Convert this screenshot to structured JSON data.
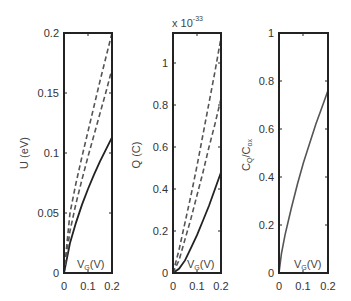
{
  "chart_data": [
    {
      "type": "line",
      "panel": "left",
      "xlabel": "V_G(V)",
      "ylabel": "U (eV)",
      "xlim": [
        0,
        0.2
      ],
      "ylim": [
        0,
        0.2
      ],
      "xticks": [
        "0",
        "0.1",
        "0.2"
      ],
      "yticks": [
        "0",
        "0.05",
        "0.1",
        "0.15",
        "0.2"
      ],
      "grid": false,
      "x": [
        0,
        0.025,
        0.05,
        0.075,
        0.1,
        0.125,
        0.15,
        0.175,
        0.2
      ],
      "series": [
        {
          "name": "solid",
          "style": "solid",
          "values": [
            0,
            0.025,
            0.042,
            0.057,
            0.07,
            0.082,
            0.093,
            0.103,
            0.113
          ]
        },
        {
          "name": "dashed-inner",
          "style": "dashed",
          "values": [
            0,
            0.035,
            0.058,
            0.078,
            0.097,
            0.115,
            0.133,
            0.151,
            0.17
          ]
        },
        {
          "name": "dashed-outer",
          "style": "dashed",
          "values": [
            0,
            0.05,
            0.075,
            0.097,
            0.118,
            0.139,
            0.16,
            0.18,
            0.2
          ]
        }
      ]
    },
    {
      "type": "line",
      "panel": "middle",
      "xlabel": "V_G(V)",
      "ylabel": "Q (C)",
      "multiplier": "x 10^-33",
      "xlim": [
        0,
        0.2
      ],
      "ylim": [
        0,
        1.143
      ],
      "xticks": [
        "0",
        "0.1",
        "0.2"
      ],
      "yticks": [
        "0",
        "0.2",
        "0.4",
        "0.6",
        "0.8",
        "1"
      ],
      "grid": false,
      "x": [
        0,
        0.025,
        0.05,
        0.075,
        0.1,
        0.125,
        0.15,
        0.175,
        0.2
      ],
      "series": [
        {
          "name": "solid",
          "style": "solid",
          "values": [
            0,
            0.02,
            0.06,
            0.12,
            0.18,
            0.25,
            0.32,
            0.4,
            0.48
          ]
        },
        {
          "name": "dashed-inner",
          "style": "dashed",
          "values": [
            0,
            0.06,
            0.16,
            0.26,
            0.37,
            0.48,
            0.6,
            0.71,
            0.83
          ]
        },
        {
          "name": "dashed-outer",
          "style": "dashed",
          "values": [
            0,
            0.11,
            0.24,
            0.37,
            0.51,
            0.66,
            0.81,
            0.96,
            1.12
          ]
        }
      ]
    },
    {
      "type": "line",
      "panel": "right",
      "xlabel": "V_G(V)",
      "ylabel": "C_Q/C_ox",
      "xlim": [
        0,
        0.2
      ],
      "ylim": [
        0,
        1
      ],
      "xticks": [
        "0",
        "0.1",
        "0.2"
      ],
      "yticks": [
        "0",
        "0.2",
        "0.4",
        "0.6",
        "0.8",
        "1"
      ],
      "grid": false,
      "x": [
        0,
        0.01,
        0.025,
        0.05,
        0.075,
        0.1,
        0.125,
        0.15,
        0.175,
        0.2
      ],
      "series": [
        {
          "name": "solid",
          "style": "solid",
          "values": [
            0,
            0.08,
            0.16,
            0.27,
            0.37,
            0.46,
            0.54,
            0.62,
            0.69,
            0.76
          ]
        }
      ]
    }
  ],
  "labels": {
    "p1": {
      "ylabel": "U (eV)",
      "xlabel_main": "V",
      "xlabel_sub": "G",
      "xlabel_rest": "(V)"
    },
    "p2": {
      "ylabel": "Q (C)",
      "multiplier_base": "x 10",
      "multiplier_exp": "-33",
      "xlabel_main": "V",
      "xlabel_sub": "G",
      "xlabel_rest": "(V)"
    },
    "p3": {
      "ylabel_main": "C",
      "ylabel_sub1": "Q",
      "ylabel_mid": "/C",
      "ylabel_sub2": "ox",
      "xlabel_main": "V",
      "xlabel_sub": "G",
      "xlabel_rest": "(V)"
    }
  },
  "ticks": {
    "x": [
      "0",
      "0.1",
      "0.2"
    ],
    "p1_y": [
      "0",
      "0.05",
      "0.1",
      "0.15",
      "0.2"
    ],
    "p2_y": [
      "0",
      "0.2",
      "0.4",
      "0.6",
      "0.8",
      "1"
    ],
    "p3_y": [
      "0",
      "0.2",
      "0.4",
      "0.6",
      "0.8",
      "1"
    ]
  }
}
